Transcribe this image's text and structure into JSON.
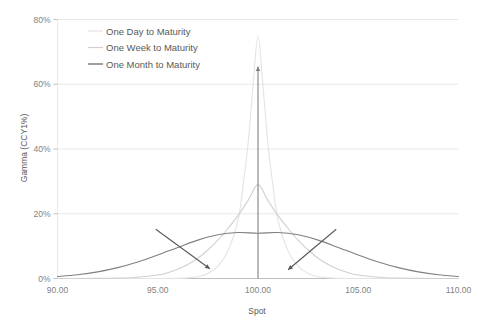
{
  "chart_data": {
    "type": "line",
    "title": "",
    "xlabel": "Spot",
    "ylabel": "Gamma (CCY1%)",
    "xlim": [
      90.0,
      110.0
    ],
    "ylim": [
      0.0,
      0.8
    ],
    "grid": true,
    "legend_position": "top-left-inside",
    "xticks": [
      90.0,
      95.0,
      100.0,
      105.0,
      110.0
    ],
    "xticklabels": [
      "90.00",
      "95.00",
      "100.00",
      "105.00",
      "110.00"
    ],
    "yticks": [
      0.0,
      0.2,
      0.4,
      0.6,
      0.8
    ],
    "yticklabels": [
      "0%",
      "20%",
      "40%",
      "60%",
      "80%"
    ],
    "series": [
      {
        "name": "One Day to Maturity",
        "color": "#e3e3e3",
        "peak_x": 100.0,
        "peak_y": 0.75,
        "sigma": 0.72,
        "x": [
          90.0,
          92.0,
          94.0,
          95.0,
          96.0,
          96.5,
          97.0,
          97.5,
          98.0,
          98.5,
          99.0,
          99.25,
          99.5,
          99.75,
          100.0,
          100.25,
          100.5,
          100.75,
          101.0,
          101.5,
          102.0,
          102.5,
          103.0,
          103.5,
          104.0,
          105.0,
          106.0,
          108.0,
          110.0
        ],
        "y": [
          0.0,
          0.0,
          0.0,
          0.0,
          0.0005,
          0.0018,
          0.0055,
          0.0155,
          0.0385,
          0.0845,
          0.1785,
          0.2845,
          0.413,
          0.593,
          0.75,
          0.593,
          0.413,
          0.2845,
          0.1785,
          0.0845,
          0.0385,
          0.0155,
          0.0055,
          0.0018,
          0.0005,
          0.0,
          0.0,
          0.0,
          0.0
        ]
      },
      {
        "name": "One Week to Maturity",
        "color": "#d0d0d0",
        "peak_x": 100.0,
        "peak_y": 0.29,
        "sigma": 1.9,
        "x": [
          90.0,
          92.0,
          93.0,
          94.0,
          95.0,
          95.5,
          96.0,
          96.5,
          97.0,
          97.5,
          98.0,
          98.5,
          99.0,
          99.5,
          100.0,
          100.5,
          101.0,
          101.5,
          102.0,
          102.5,
          103.0,
          103.5,
          104.0,
          104.5,
          105.0,
          106.0,
          107.0,
          108.0,
          110.0
        ],
        "y": [
          0.0,
          0.0004,
          0.0013,
          0.004,
          0.011,
          0.018,
          0.0285,
          0.043,
          0.0625,
          0.088,
          0.1185,
          0.1545,
          0.194,
          0.2405,
          0.29,
          0.2405,
          0.194,
          0.1545,
          0.1185,
          0.088,
          0.0625,
          0.043,
          0.0285,
          0.018,
          0.011,
          0.004,
          0.0013,
          0.0004,
          0.0
        ]
      },
      {
        "name": "One Month to Maturity",
        "color": "#808080",
        "peak_x": 100.0,
        "peak_y": 0.14,
        "sigma": 4.0,
        "x": [
          90.0,
          91.0,
          92.0,
          93.0,
          94.0,
          95.0,
          96.0,
          97.0,
          98.0,
          99.0,
          100.0,
          101.0,
          102.0,
          103.0,
          104.0,
          105.0,
          106.0,
          107.0,
          108.0,
          109.0,
          110.0
        ],
        "y": [
          0.0062,
          0.0117,
          0.0205,
          0.0336,
          0.051,
          0.0725,
          0.096,
          0.1185,
          0.135,
          0.142,
          0.14,
          0.142,
          0.135,
          0.1185,
          0.096,
          0.0725,
          0.051,
          0.0336,
          0.0205,
          0.0117,
          0.0062
        ]
      }
    ],
    "annotations": [
      {
        "name": "vertical-up-arrow",
        "from_x": 100.0,
        "from_y": 0.0,
        "to_x": 100.0,
        "to_y": 0.655,
        "color": "#808080"
      },
      {
        "name": "left-inward-arrow",
        "from_x": 94.9,
        "from_y": 0.152,
        "to_x": 97.6,
        "to_y": 0.03,
        "color": "#595959"
      },
      {
        "name": "right-inward-arrow",
        "from_x": 103.9,
        "from_y": 0.152,
        "to_x": 101.5,
        "to_y": 0.027,
        "color": "#595959"
      }
    ]
  },
  "legend": {
    "items": [
      {
        "label": "One Day to Maturity",
        "color": "#e3e3e3"
      },
      {
        "label": "One Week to Maturity",
        "color": "#d0d0d0"
      },
      {
        "label": "One Month to Maturity",
        "color": "#808080"
      }
    ]
  },
  "colors": {
    "grid": "#e8e8e8",
    "axis": "#bfbfbf",
    "tick_label": "#7f7f7f",
    "axis_title": "#595959",
    "background": "#ffffff"
  }
}
